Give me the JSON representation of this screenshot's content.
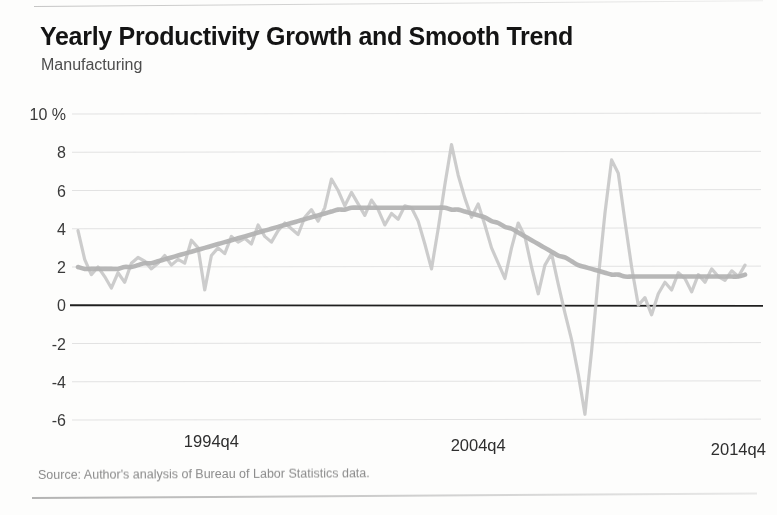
{
  "figure": {
    "title": "Yearly Productivity Growth and Smooth Trend",
    "subtitle": "Manufacturing",
    "source": "Source: Author's analysis of Bureau of Labor Statistics data."
  },
  "colors": {
    "series_line": "#c6c6c6",
    "trend_line": "#b3b3b3",
    "zero_line": "#1f1f1f",
    "gridline": "#e2e2e2",
    "title_text": "#141414",
    "subtitle_text": "#4d4d4d",
    "source_text": "#8a8a8a",
    "background": "#fdfdfc"
  },
  "chart_data": {
    "type": "line",
    "title": "Yearly Productivity Growth and Smooth Trend",
    "subtitle": "Manufacturing",
    "xlabel": "",
    "ylabel": "10 %",
    "ylim": [
      -6,
      10
    ],
    "xlim": [
      "1989q4",
      "2014q4"
    ],
    "grid": true,
    "legend": false,
    "yticks": [
      10,
      8,
      6,
      4,
      2,
      0,
      -2,
      -4,
      -6
    ],
    "ytick_labels": [
      "10 %",
      "8",
      "6",
      "4",
      "2",
      "0",
      "-2",
      "-4",
      "-6"
    ],
    "xticks": [
      "1994q4",
      "2004q4",
      "2014q4"
    ],
    "xtick_labels": [
      "1994q4",
      "2004q4",
      "2014q4"
    ],
    "zero_reference_line": 0,
    "x": [
      "1989q4",
      "1990q1",
      "1990q2",
      "1990q3",
      "1990q4",
      "1991q1",
      "1991q2",
      "1991q3",
      "1991q4",
      "1992q1",
      "1992q2",
      "1992q3",
      "1992q4",
      "1993q1",
      "1993q2",
      "1993q3",
      "1993q4",
      "1994q1",
      "1994q2",
      "1994q3",
      "1994q4",
      "1995q1",
      "1995q2",
      "1995q3",
      "1995q4",
      "1996q1",
      "1996q2",
      "1996q3",
      "1996q4",
      "1997q1",
      "1997q2",
      "1997q3",
      "1997q4",
      "1998q1",
      "1998q2",
      "1998q3",
      "1998q4",
      "1999q1",
      "1999q2",
      "1999q3",
      "1999q4",
      "2000q1",
      "2000q2",
      "2000q3",
      "2000q4",
      "2001q1",
      "2001q2",
      "2001q3",
      "2001q4",
      "2002q1",
      "2002q2",
      "2002q3",
      "2002q4",
      "2003q1",
      "2003q2",
      "2003q3",
      "2003q4",
      "2004q1",
      "2004q2",
      "2004q3",
      "2004q4",
      "2005q1",
      "2005q2",
      "2005q3",
      "2005q4",
      "2006q1",
      "2006q2",
      "2006q3",
      "2006q4",
      "2007q1",
      "2007q2",
      "2007q3",
      "2007q4",
      "2008q1",
      "2008q2",
      "2008q3",
      "2008q4",
      "2009q1",
      "2009q2",
      "2009q3",
      "2009q4",
      "2010q1",
      "2010q2",
      "2010q3",
      "2010q4",
      "2011q1",
      "2011q2",
      "2011q3",
      "2011q4",
      "2012q1",
      "2012q2",
      "2012q3",
      "2012q4",
      "2013q1",
      "2013q2",
      "2013q3",
      "2013q4",
      "2014q1",
      "2014q2",
      "2014q3",
      "2014q4"
    ],
    "series": [
      {
        "name": "Yearly productivity growth",
        "style": "jagged",
        "color": "#c6c6c6",
        "values": [
          3.9,
          2.4,
          1.6,
          2.0,
          1.5,
          0.9,
          1.7,
          1.2,
          2.2,
          2.5,
          2.3,
          1.9,
          2.2,
          2.6,
          2.1,
          2.4,
          2.2,
          3.4,
          3.0,
          0.8,
          2.6,
          3.0,
          2.7,
          3.6,
          3.3,
          3.5,
          3.2,
          4.2,
          3.6,
          3.3,
          3.9,
          4.3,
          4.0,
          3.7,
          4.6,
          5.0,
          4.4,
          5.1,
          6.6,
          6.0,
          5.2,
          5.9,
          5.3,
          4.7,
          5.5,
          5.0,
          4.2,
          4.8,
          4.5,
          5.2,
          5.1,
          4.4,
          3.2,
          1.9,
          4.0,
          6.3,
          8.4,
          6.8,
          5.6,
          4.6,
          5.3,
          4.2,
          3.0,
          2.2,
          1.4,
          3.0,
          4.3,
          3.6,
          2.0,
          0.6,
          2.1,
          2.7,
          1.1,
          -0.4,
          -1.8,
          -3.6,
          -5.7,
          -2.4,
          1.4,
          4.8,
          7.6,
          6.9,
          4.4,
          2.0,
          0.0,
          0.4,
          -0.5,
          0.6,
          1.2,
          0.8,
          1.7,
          1.4,
          0.7,
          1.6,
          1.2,
          1.9,
          1.5,
          1.3,
          1.8,
          1.5,
          2.1
        ]
      },
      {
        "name": "Smooth trend",
        "style": "smooth",
        "color": "#b3b3b3",
        "values": [
          2.0,
          1.9,
          1.9,
          1.9,
          1.9,
          1.9,
          1.9,
          2.0,
          2.0,
          2.1,
          2.2,
          2.2,
          2.3,
          2.4,
          2.5,
          2.6,
          2.7,
          2.8,
          2.9,
          3.0,
          3.1,
          3.2,
          3.3,
          3.4,
          3.5,
          3.6,
          3.7,
          3.8,
          3.9,
          4.0,
          4.1,
          4.2,
          4.3,
          4.4,
          4.5,
          4.6,
          4.7,
          4.8,
          4.9,
          5.0,
          5.0,
          5.1,
          5.1,
          5.1,
          5.1,
          5.1,
          5.1,
          5.1,
          5.1,
          5.1,
          5.1,
          5.1,
          5.1,
          5.1,
          5.1,
          5.1,
          5.0,
          5.0,
          4.9,
          4.8,
          4.7,
          4.6,
          4.4,
          4.3,
          4.1,
          4.0,
          3.8,
          3.6,
          3.4,
          3.2,
          3.0,
          2.8,
          2.6,
          2.5,
          2.3,
          2.1,
          2.0,
          1.9,
          1.8,
          1.7,
          1.6,
          1.6,
          1.5,
          1.5,
          1.5,
          1.5,
          1.5,
          1.5,
          1.5,
          1.5,
          1.5,
          1.5,
          1.5,
          1.5,
          1.5,
          1.5,
          1.5,
          1.5,
          1.5,
          1.5,
          1.6
        ]
      }
    ]
  }
}
